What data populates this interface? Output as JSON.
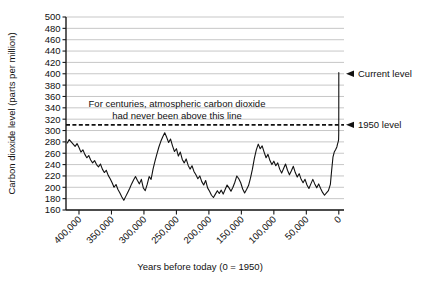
{
  "chart_data": {
    "type": "line",
    "title": "",
    "xlabel": "Years before today (0 = 1950)",
    "ylabel": "Carbon dioxide level (parts per million)",
    "xlim": [
      420000,
      -8000
    ],
    "ylim": [
      160,
      500
    ],
    "x_ticks": [
      400000,
      350000,
      300000,
      250000,
      200000,
      150000,
      100000,
      50000,
      0
    ],
    "x_tick_labels": [
      "400,000",
      "350,000",
      "300,000",
      "250,000",
      "200,000",
      "150,000",
      "100,000",
      "50,000",
      "0"
    ],
    "y_ticks": [
      160,
      180,
      200,
      220,
      240,
      260,
      280,
      300,
      320,
      340,
      360,
      380,
      400,
      420,
      440,
      460,
      480,
      500
    ],
    "y_tick_labels": [
      "160",
      "180",
      "200",
      "220",
      "240",
      "260",
      "280",
      "300",
      "320",
      "340",
      "360",
      "380",
      "400",
      "420",
      "440",
      "460",
      "480",
      "500"
    ],
    "grid": true,
    "legend": "none",
    "series": [
      {
        "name": "Atmospheric CO2 (ice core record)",
        "color": "#111111",
        "points": [
          [
            418000,
            278
          ],
          [
            415000,
            284
          ],
          [
            412000,
            280
          ],
          [
            409000,
            276
          ],
          [
            406000,
            272
          ],
          [
            403000,
            277
          ],
          [
            400000,
            270
          ],
          [
            397000,
            262
          ],
          [
            394000,
            266
          ],
          [
            391000,
            258
          ],
          [
            388000,
            252
          ],
          [
            385000,
            256
          ],
          [
            382000,
            248
          ],
          [
            379000,
            243
          ],
          [
            376000,
            247
          ],
          [
            373000,
            240
          ],
          [
            370000,
            236
          ],
          [
            367000,
            241
          ],
          [
            364000,
            232
          ],
          [
            361000,
            226
          ],
          [
            358000,
            230
          ],
          [
            355000,
            221
          ],
          [
            352000,
            215
          ],
          [
            349000,
            208
          ],
          [
            346000,
            200
          ],
          [
            343000,
            205
          ],
          [
            340000,
            196
          ],
          [
            337000,
            190
          ],
          [
            334000,
            183
          ],
          [
            331000,
            177
          ],
          [
            328000,
            184
          ],
          [
            325000,
            191
          ],
          [
            322000,
            198
          ],
          [
            319000,
            206
          ],
          [
            316000,
            213
          ],
          [
            313000,
            219
          ],
          [
            310000,
            212
          ],
          [
            307000,
            206
          ],
          [
            304000,
            214
          ],
          [
            301000,
            199
          ],
          [
            298000,
            194
          ],
          [
            295000,
            205
          ],
          [
            292000,
            219
          ],
          [
            289000,
            214
          ],
          [
            286000,
            232
          ],
          [
            283000,
            246
          ],
          [
            280000,
            259
          ],
          [
            277000,
            271
          ],
          [
            274000,
            281
          ],
          [
            271000,
            289
          ],
          [
            268000,
            296
          ],
          [
            265000,
            288
          ],
          [
            262000,
            279
          ],
          [
            259000,
            285
          ],
          [
            256000,
            273
          ],
          [
            253000,
            263
          ],
          [
            250000,
            268
          ],
          [
            247000,
            255
          ],
          [
            244000,
            262
          ],
          [
            241000,
            249
          ],
          [
            238000,
            243
          ],
          [
            235000,
            250
          ],
          [
            232000,
            239
          ],
          [
            229000,
            232
          ],
          [
            226000,
            238
          ],
          [
            223000,
            228
          ],
          [
            220000,
            222
          ],
          [
            217000,
            215
          ],
          [
            214000,
            220
          ],
          [
            211000,
            210
          ],
          [
            208000,
            204
          ],
          [
            205000,
            212
          ],
          [
            202000,
            199
          ],
          [
            199000,
            193
          ],
          [
            196000,
            186
          ],
          [
            193000,
            182
          ],
          [
            190000,
            188
          ],
          [
            187000,
            194
          ],
          [
            184000,
            189
          ],
          [
            181000,
            195
          ],
          [
            178000,
            188
          ],
          [
            175000,
            196
          ],
          [
            172000,
            204
          ],
          [
            169000,
            199
          ],
          [
            166000,
            193
          ],
          [
            163000,
            200
          ],
          [
            160000,
            209
          ],
          [
            157000,
            220
          ],
          [
            154000,
            215
          ],
          [
            151000,
            208
          ],
          [
            148000,
            197
          ],
          [
            145000,
            190
          ],
          [
            142000,
            196
          ],
          [
            139000,
            203
          ],
          [
            136000,
            216
          ],
          [
            133000,
            232
          ],
          [
            130000,
            251
          ],
          [
            127000,
            266
          ],
          [
            124000,
            276
          ],
          [
            121000,
            268
          ],
          [
            118000,
            273
          ],
          [
            115000,
            262
          ],
          [
            112000,
            252
          ],
          [
            109000,
            258
          ],
          [
            106000,
            247
          ],
          [
            103000,
            240
          ],
          [
            100000,
            246
          ],
          [
            97000,
            238
          ],
          [
            94000,
            243
          ],
          [
            91000,
            232
          ],
          [
            88000,
            225
          ],
          [
            85000,
            233
          ],
          [
            82000,
            241
          ],
          [
            79000,
            230
          ],
          [
            76000,
            222
          ],
          [
            73000,
            229
          ],
          [
            70000,
            237
          ],
          [
            67000,
            226
          ],
          [
            64000,
            218
          ],
          [
            61000,
            224
          ],
          [
            58000,
            214
          ],
          [
            55000,
            208
          ],
          [
            52000,
            214
          ],
          [
            49000,
            204
          ],
          [
            46000,
            198
          ],
          [
            43000,
            206
          ],
          [
            40000,
            214
          ],
          [
            37000,
            206
          ],
          [
            34000,
            199
          ],
          [
            31000,
            206
          ],
          [
            28000,
            198
          ],
          [
            25000,
            191
          ],
          [
            22000,
            186
          ],
          [
            19000,
            190
          ],
          [
            16000,
            194
          ],
          [
            13000,
            205
          ],
          [
            11000,
            230
          ],
          [
            9000,
            253
          ],
          [
            7000,
            262
          ],
          [
            5000,
            266
          ],
          [
            3000,
            271
          ],
          [
            2000,
            276
          ],
          [
            1000,
            280
          ],
          [
            300,
            284
          ],
          [
            100,
            296
          ],
          [
            60,
            315
          ],
          [
            40,
            340
          ],
          [
            20,
            370
          ],
          [
            5,
            395
          ],
          [
            -2,
            402
          ]
        ]
      }
    ],
    "threshold_line": {
      "value": 310,
      "style": "dashed"
    },
    "annotations": [
      {
        "name": "centuries-note",
        "lines": [
          "For centuries, atmospheric carbon dioxide",
          "had never been above this line"
        ]
      }
    ],
    "callouts": [
      {
        "name": "current-level",
        "label": "Current level",
        "value": 400
      },
      {
        "name": "nineteen-fifty-level",
        "label": "1950 level",
        "value": 310
      }
    ]
  },
  "colors": {
    "line": "#111111",
    "grid": "#b9b9b9",
    "axis": "#1a1a1a",
    "background": "#ffffff"
  }
}
